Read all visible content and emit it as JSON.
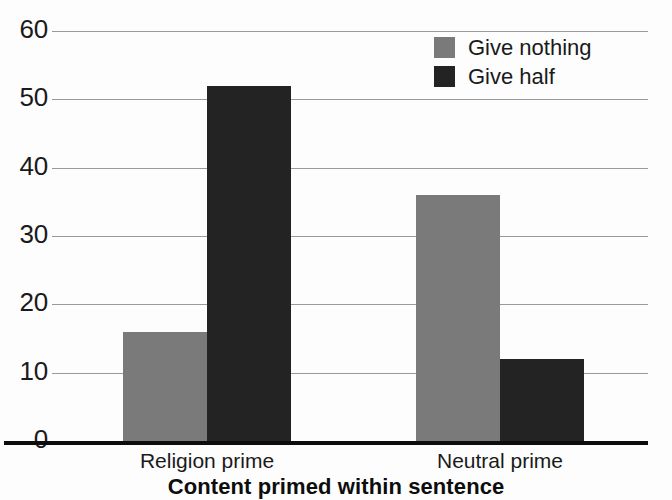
{
  "chart_data": {
    "type": "bar",
    "title": "",
    "xlabel": "Content primed within sentence",
    "ylabel": "",
    "categories": [
      "Religion prime",
      "Neutral prime"
    ],
    "series": [
      {
        "name": "Give nothing",
        "color": "#7a7a7a",
        "values": [
          16,
          36
        ]
      },
      {
        "name": "Give half",
        "color": "#232323",
        "values": [
          52,
          12
        ]
      }
    ],
    "ylim": [
      0,
      60
    ],
    "yticks": [
      0,
      10,
      20,
      30,
      40,
      50,
      60
    ],
    "ytick_labels": [
      "0",
      "10",
      "20",
      "30",
      "40",
      "50",
      "60"
    ],
    "grid": true,
    "grid_axis": "y",
    "legend_position": "top-right",
    "bar_group_gap": "grouped-adjacent",
    "axis_line_color": "#0d0d0d",
    "grid_color": "#9a9a9a",
    "background": "#fdfdfd"
  },
  "legend": {
    "entries": [
      {
        "label": "Give nothing",
        "swatch": "#7a7a7a"
      },
      {
        "label": "Give half",
        "swatch": "#232323"
      }
    ]
  },
  "axis": {
    "x_title": "Content primed within sentence",
    "category_labels": [
      "Religion prime",
      "Neutral prime"
    ],
    "y_tick_labels": [
      "60",
      "50",
      "40",
      "30",
      "20",
      "10",
      "0"
    ]
  }
}
